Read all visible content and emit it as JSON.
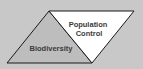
{
  "diagram": {
    "background_color": "#c8c8c8",
    "shapes": [
      {
        "id": "left-triangle",
        "label": "Biodiversity",
        "fill": "#bdbdbd"
      },
      {
        "id": "right-triangle",
        "label_lines": [
          "Population",
          "Control"
        ],
        "fill": "#ffffff"
      }
    ],
    "labels": {
      "biodiversity": "Biodiversity",
      "population": "Population",
      "control": "Control"
    }
  }
}
